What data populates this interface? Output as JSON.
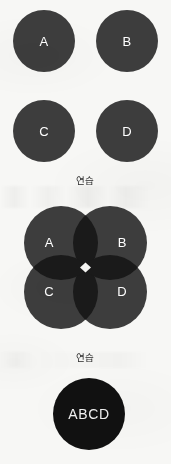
{
  "page": {
    "background_color": "#f7f7f5",
    "width": 171,
    "height": 464
  },
  "colors": {
    "circle_fill": "#3d3d3d",
    "intersection_fill": "#1a1a1a",
    "union_fill": "#111111",
    "label_text": "#ffffff",
    "caption_text": "#2a2a2a",
    "gap_fill": "#f7f7f5"
  },
  "figures": [
    {
      "id": "separate-sets",
      "type": "four-disjoint-circles",
      "circles": [
        {
          "id": "A",
          "label": "A",
          "cx": 44,
          "cy": 41,
          "r": 31
        },
        {
          "id": "B",
          "label": "B",
          "cx": 127,
          "cy": 41,
          "r": 31
        },
        {
          "id": "C",
          "label": "C",
          "cx": 44,
          "cy": 131,
          "r": 31
        },
        {
          "id": "D",
          "label": "D",
          "cx": 127,
          "cy": 131,
          "r": 31
        }
      ],
      "caption": "연습",
      "caption_y": 176
    },
    {
      "id": "overlapping-sets",
      "type": "four-overlapping-circles",
      "circles": [
        {
          "id": "A",
          "label": "A",
          "cx": 61,
          "cy": 243,
          "r": 37
        },
        {
          "id": "B",
          "label": "B",
          "cx": 110,
          "cy": 243,
          "r": 37
        },
        {
          "id": "C",
          "label": "C",
          "cx": 61,
          "cy": 292,
          "r": 37
        },
        {
          "id": "D",
          "label": "D",
          "cx": 110,
          "cy": 292,
          "r": 37
        }
      ],
      "label_offsets": [
        {
          "id": "A",
          "x": 49,
          "y": 243
        },
        {
          "id": "B",
          "x": 122,
          "y": 243
        },
        {
          "id": "C",
          "x": 49,
          "y": 292
        },
        {
          "id": "D",
          "x": 122,
          "y": 292
        }
      ],
      "center_gap": {
        "cx": 85.5,
        "cy": 267.5,
        "half_diagonal": 5
      },
      "caption": "연습",
      "caption_y": 353
    },
    {
      "id": "union-set",
      "type": "single-filled-circle",
      "circle": {
        "id": "ABCD",
        "label": "ABCD",
        "cx": 89,
        "cy": 414,
        "r": 36
      }
    }
  ]
}
